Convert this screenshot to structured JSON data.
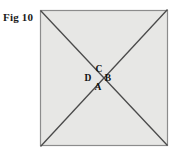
{
  "figure": {
    "caption": "Fig 10",
    "colors": {
      "page_background": "#ffffff",
      "square_fill": "#e7e7e5",
      "square_border": "#8c8c8c",
      "diagonal_line": "#4a4a4a",
      "label_text": "#111111"
    },
    "square": {
      "name": "outer-square",
      "x": 40,
      "y": 10,
      "width": 128,
      "height": 136,
      "border_width": 1.2
    },
    "diagonals": [
      {
        "name": "diagonal-top-left-to-bottom-right",
        "x1": 40,
        "y1": 10,
        "x2": 168,
        "y2": 146
      },
      {
        "name": "diagonal-bottom-left-to-top-right",
        "x1": 40,
        "y1": 146,
        "x2": 168,
        "y2": 10
      }
    ],
    "labels": [
      {
        "id": "C",
        "text": "C",
        "x": 99,
        "y": 72,
        "position": "top"
      },
      {
        "id": "B",
        "text": "B",
        "x": 108,
        "y": 81,
        "position": "right"
      },
      {
        "id": "D",
        "text": "D",
        "x": 88,
        "y": 81,
        "position": "left"
      },
      {
        "id": "A",
        "text": "A",
        "x": 98,
        "y": 90,
        "position": "bottom"
      }
    ]
  },
  "chart_data": {
    "type": "diagram",
    "title": "Fig 10",
    "shapes": [
      {
        "kind": "square",
        "corners": [
          [
            40,
            10
          ],
          [
            168,
            10
          ],
          [
            168,
            146
          ],
          [
            40,
            146
          ]
        ]
      },
      {
        "kind": "line",
        "from": [
          40,
          10
        ],
        "to": [
          168,
          146
        ]
      },
      {
        "kind": "line",
        "from": [
          40,
          146
        ],
        "to": [
          168,
          10
        ]
      }
    ],
    "point_labels": [
      "A",
      "B",
      "C",
      "D"
    ]
  }
}
